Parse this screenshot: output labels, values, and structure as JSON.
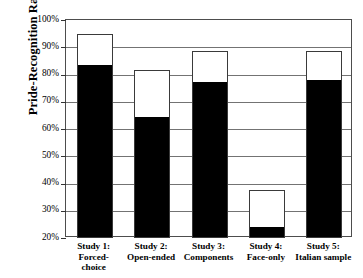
{
  "chart_data": {
    "type": "bar",
    "title": "",
    "xlabel": "",
    "ylabel": "Pride-Recognition Rate",
    "ylim": [
      20,
      100
    ],
    "ytick_labels": [
      "100%",
      "90%",
      "80%",
      "70%",
      "60%",
      "50%",
      "40%",
      "30%",
      "20%"
    ],
    "ytick_values": [
      100,
      90,
      80,
      70,
      60,
      50,
      40,
      30,
      20
    ],
    "grid": true,
    "legend": "none",
    "stacked": true,
    "categories": [
      "Study 1:\nForced-choice",
      "Study 2:\nOpen-ended",
      "Study 3:\nComponents",
      "Study 4:\nFace-only",
      "Study 5:\nItalian sample"
    ],
    "category_lines": [
      [
        "Study 1:",
        "Forced-",
        "choice"
      ],
      [
        "Study 2:",
        "Open-ended"
      ],
      [
        "Study 3:",
        "Components"
      ],
      [
        "Study 4:",
        "Face-only"
      ],
      [
        "Study 5:",
        "Italian sample"
      ]
    ],
    "series": [
      {
        "name": "black-segment",
        "color": "#000000",
        "values": [
          83,
          64,
          77,
          23.5,
          77.5
        ]
      },
      {
        "name": "white-segment-top",
        "color": "#ffffff",
        "values": [
          95,
          81.5,
          88.5,
          37.5,
          88.5
        ]
      }
    ],
    "colors": {
      "black_fill": "#000000",
      "white_fill": "#ffffff",
      "bar_outline": "#3a3a3a",
      "gridline": "#737373",
      "frame": "#4d4d4d",
      "background": "#ffffff"
    }
  }
}
